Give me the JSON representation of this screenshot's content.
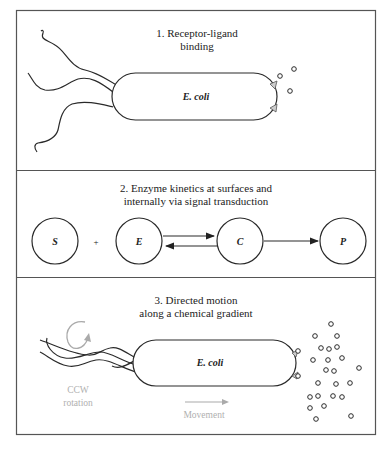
{
  "panels": [
    {
      "title_line1": "1. Receptor-ligand",
      "title_line2": "binding",
      "cell_label": "E. coli"
    },
    {
      "title_line1": "2. Enzyme kinetics at surfaces and",
      "title_line2": "internally via signal transduction",
      "nodes": [
        {
          "label": "S"
        },
        {
          "label": "+"
        },
        {
          "label": "E"
        },
        {
          "label": "C"
        },
        {
          "label": "P"
        }
      ]
    },
    {
      "title_line1": "3. Directed motion",
      "title_line2": "along a chemical gradient",
      "cell_label": "E. coli",
      "rotation_line1": "CCW",
      "rotation_line2": "rotation",
      "movement_label": "Movement"
    }
  ],
  "colors": {
    "line": "#2a2a2a",
    "annotation_grey": "#b0b0b0",
    "frame": "#555555"
  }
}
